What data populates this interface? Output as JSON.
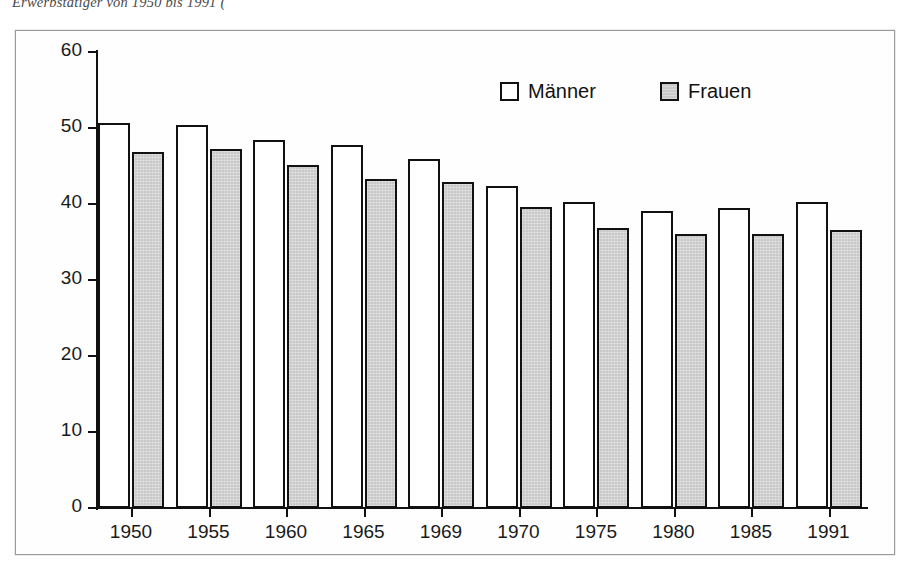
{
  "caption": {
    "text": "Erwerbstätiger von 1950 bis 1991 ("
  },
  "chart_data": {
    "type": "bar",
    "title": "",
    "xlabel": "",
    "ylabel": "",
    "ylim": [
      0,
      60
    ],
    "yticks": [
      0,
      10,
      20,
      30,
      40,
      50,
      60
    ],
    "grid": false,
    "legend_position": "top-center",
    "categories": [
      "1950",
      "1955",
      "1960",
      "1965",
      "1969",
      "1970",
      "1975",
      "1980",
      "1985",
      "1991"
    ],
    "series": [
      {
        "name": "Männer",
        "color": "#ffffff",
        "values": [
          50.6,
          50.4,
          48.4,
          47.7,
          45.9,
          42.4,
          40.2,
          39.1,
          39.5,
          40.2
        ]
      },
      {
        "name": "Frauen",
        "color": "#c9c9c9",
        "values": [
          46.8,
          47.2,
          45.1,
          43.3,
          42.9,
          39.6,
          36.8,
          36.1,
          36.1,
          36.6
        ]
      }
    ]
  }
}
